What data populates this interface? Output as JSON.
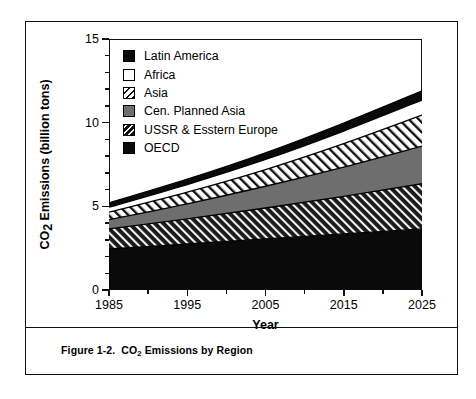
{
  "figure": {
    "caption_prefix": "Figure 1-2.  CO",
    "caption_sub": "2",
    "caption_suffix": " Emissions by Region"
  },
  "axes": {
    "y_title_prefix": "CO",
    "y_title_sub": "2",
    "y_title_suffix": " Emissions (billion tons)",
    "x_title": "Year",
    "y_ticks": [
      "0",
      "5",
      "10",
      "15"
    ],
    "x_ticks": [
      "1985",
      "1995",
      "2005",
      "2015",
      "2025"
    ]
  },
  "legend": {
    "position": "top-left-inside",
    "items": [
      {
        "label": "Latin America",
        "pattern": "solid-black",
        "color": "#000000"
      },
      {
        "label": "Africa",
        "pattern": "solid-white",
        "color": "#ffffff"
      },
      {
        "label": "Asia",
        "pattern": "diagonal-hatch-light",
        "color": "#ffffff"
      },
      {
        "label": "Cen. Planned Asia",
        "pattern": "solid-gray",
        "color": "#6e6e6e"
      },
      {
        "label": "USSR & Esstern Europe",
        "pattern": "diagonal-hatch-dark",
        "color": "#2b2b2b"
      },
      {
        "label": "OECD",
        "pattern": "solid-black",
        "color": "#000000"
      }
    ]
  },
  "chart_data": {
    "type": "area",
    "stacked": true,
    "title": "Figure 1-2.  CO2 Emissions by Region",
    "xlabel": "Year",
    "ylabel": "CO2 Emissions (billion tons)",
    "xlim": [
      1985,
      2025
    ],
    "ylim": [
      0,
      15
    ],
    "grid": false,
    "x": [
      1985,
      1995,
      2005,
      2015,
      2025
    ],
    "stack_order_bottom_to_top": [
      "OECD",
      "USSR & Esstern Europe",
      "Cen. Planned Asia",
      "Asia",
      "Africa",
      "Latin America"
    ],
    "series": [
      {
        "name": "OECD",
        "pattern": "solid-black",
        "values": [
          2.45,
          2.75,
          3.05,
          3.35,
          3.65
        ]
      },
      {
        "name": "USSR & Esstern Europe",
        "pattern": "diagonal-hatch-dark",
        "values": [
          1.2,
          1.5,
          1.85,
          2.25,
          2.7
        ]
      },
      {
        "name": "Cen. Planned Asia",
        "pattern": "solid-gray",
        "values": [
          0.55,
          0.9,
          1.3,
          1.75,
          2.25
        ]
      },
      {
        "name": "Asia",
        "pattern": "diagonal-hatch-light",
        "values": [
          0.45,
          0.7,
          1.0,
          1.4,
          1.85
        ]
      },
      {
        "name": "Africa",
        "pattern": "solid-white",
        "values": [
          0.3,
          0.45,
          0.6,
          0.75,
          0.9
        ]
      },
      {
        "name": "Latin America",
        "pattern": "solid-black",
        "values": [
          0.25,
          0.32,
          0.4,
          0.48,
          0.55
        ]
      }
    ],
    "totals": [
      5.2,
      6.62,
      8.2,
      9.98,
      11.9
    ]
  }
}
